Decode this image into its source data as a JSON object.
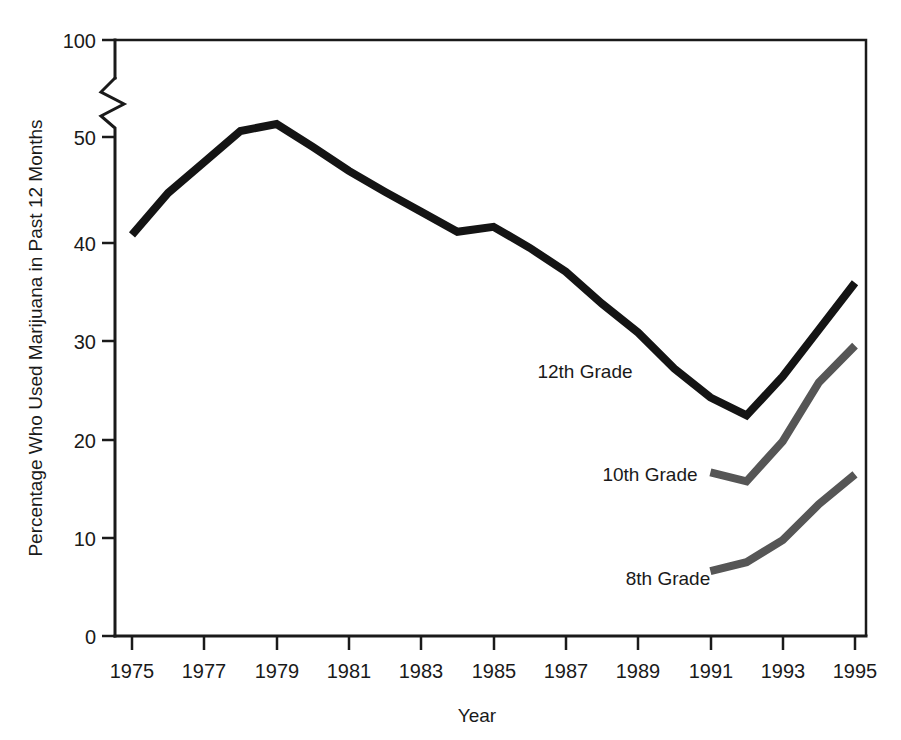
{
  "chart_data": {
    "type": "line",
    "title": "",
    "xlabel": "Year",
    "ylabel": "Percentage Who Used Marijuana in Past 12 Months",
    "x": [
      1975,
      1976,
      1977,
      1978,
      1979,
      1980,
      1981,
      1982,
      1983,
      1984,
      1985,
      1986,
      1987,
      1988,
      1989,
      1990,
      1991,
      1992,
      1993,
      1994,
      1995
    ],
    "xlim": [
      1974,
      1996
    ],
    "ylim": [
      0,
      100
    ],
    "y_axis_break": {
      "from": 55,
      "to": 95,
      "present": true
    },
    "grid": false,
    "legend_position": "inline-labels",
    "xticks_major": [
      1975,
      1977,
      1979,
      1981,
      1983,
      1985,
      1987,
      1989,
      1991,
      1993,
      1995
    ],
    "xticks_minor": [
      1976,
      1978,
      1980,
      1982,
      1984,
      1986,
      1988,
      1990,
      1992,
      1994
    ],
    "yticks": [
      0,
      10,
      20,
      30,
      40,
      50,
      100
    ],
    "series": [
      {
        "name": "12th Grade",
        "color": "#141414",
        "x": [
          1975,
          1976,
          1977,
          1978,
          1979,
          1980,
          1981,
          1982,
          1983,
          1984,
          1985,
          1986,
          1987,
          1988,
          1989,
          1990,
          1991,
          1992,
          1993,
          1994,
          1995
        ],
        "values": [
          40.2,
          44.4,
          47.5,
          50.6,
          51.3,
          49.0,
          46.6,
          44.5,
          42.5,
          40.5,
          41.0,
          38.9,
          36.5,
          33.3,
          30.4,
          26.8,
          23.9,
          22.1,
          26.0,
          30.7,
          35.4
        ]
      },
      {
        "name": "10th Grade",
        "color": "#565656",
        "x": [
          1991,
          1992,
          1993,
          1994,
          1995
        ],
        "values": [
          16.4,
          15.5,
          19.5,
          25.4,
          29.1
        ]
      },
      {
        "name": "8th Grade",
        "color": "#565656",
        "x": [
          1991,
          1992,
          1993,
          1994,
          1995
        ],
        "values": [
          6.5,
          7.4,
          9.6,
          13.2,
          16.2
        ]
      }
    ],
    "annotations": [
      {
        "text": "12th Grade",
        "x": 1985.3,
        "y": 27.5,
        "anchor": "middle"
      },
      {
        "text": "10th Grade",
        "x": 1988.8,
        "y": 16.8,
        "anchor": "middle"
      },
      {
        "text": "8th Grade",
        "x": 1989.9,
        "y": 6.2,
        "anchor": "middle"
      }
    ],
    "tick_labels_y": [
      "0",
      "10",
      "20",
      "30",
      "40",
      "50",
      "100"
    ],
    "tick_labels_x": [
      "1975",
      "1977",
      "1979",
      "1981",
      "1983",
      "1985",
      "1987",
      "1989",
      "1991",
      "1993",
      "1995"
    ]
  },
  "colors": {
    "background": "#ffffff",
    "axis": "#1a1a1a",
    "series_dark": "#141414",
    "series_gray": "#565656"
  }
}
